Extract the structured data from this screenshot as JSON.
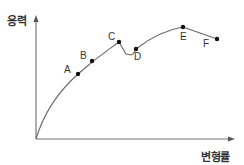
{
  "chart_data": {
    "type": "line",
    "title": "",
    "xlabel": "변형률",
    "ylabel": "응력",
    "grid": false,
    "legend": null,
    "points": [
      {
        "label": "A",
        "x": 78,
        "y": 74
      },
      {
        "label": "B",
        "x": 92,
        "y": 61
      },
      {
        "label": "C",
        "x": 119,
        "y": 42
      },
      {
        "label": "D",
        "x": 136,
        "y": 49
      },
      {
        "label": "E",
        "x": 183,
        "y": 27
      },
      {
        "label": "F",
        "x": 217,
        "y": 39
      }
    ],
    "curve_path": "M36,139 C44,112 58,92 78,74 S108,50 119,42 L126,54 L131,55 L133,54 L136,49 C150,38 165,30 183,27 L217,39"
  },
  "labels": {
    "y_axis": "응력",
    "x_axis": "변형률",
    "A": "A",
    "B": "B",
    "C": "C",
    "D": "D",
    "E": "E",
    "F": "F"
  },
  "colors": {
    "axis": "#777777",
    "curve": "#666666",
    "point": "#111111"
  }
}
